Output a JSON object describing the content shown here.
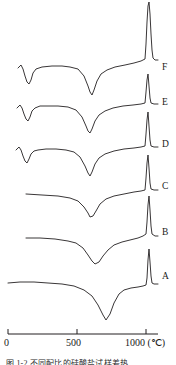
{
  "figure": {
    "kind": "thermal-analysis-curves",
    "caption_fragment": "图 1-2  不同配比的硅酸盐试样差热"
  },
  "axis": {
    "label_unit": "(℃)",
    "tick_labels": [
      "0",
      "500",
      "1000 (℃)"
    ],
    "tick_values": [
      0,
      500,
      1000
    ],
    "xmin": 0,
    "xmax": 1100
  },
  "curve_labels": [
    {
      "id": "F",
      "text": "F",
      "x": 162,
      "y": 63
    },
    {
      "id": "E",
      "text": "E",
      "x": 162,
      "y": 98
    },
    {
      "id": "D",
      "text": "D",
      "x": 162,
      "y": 140
    },
    {
      "id": "C",
      "text": "C",
      "x": 162,
      "y": 182
    },
    {
      "id": "B",
      "text": "B",
      "x": 162,
      "y": 228
    },
    {
      "id": "A",
      "text": "A",
      "x": 162,
      "y": 272
    }
  ],
  "colors": {
    "curve": "#231f20",
    "axis": "#231f20",
    "background": "#ffffff"
  },
  "chart_data": {
    "type": "line",
    "title": "",
    "xlabel": "(℃)",
    "ylabel": "",
    "xlim": [
      0,
      1100
    ],
    "grid": false,
    "legend": "right-inline",
    "tick_labels": [
      "0",
      "500",
      "1000 (℃)"
    ],
    "tick_values": [
      0,
      500,
      1000
    ],
    "series": [
      {
        "name": "A",
        "baseline_y": 283,
        "features": [
          {
            "kind": "endothermic-dip",
            "temperature_c": 690,
            "depth_px": 37
          },
          {
            "kind": "exothermic-peak",
            "temperature_c": 1010,
            "height_px": 35
          }
        ],
        "points": [
          [
            8,
            283
          ],
          [
            20,
            282
          ],
          [
            34,
            282
          ],
          [
            48,
            283
          ],
          [
            62,
            284
          ],
          [
            74,
            286
          ],
          [
            84,
            290
          ],
          [
            92,
            296
          ],
          [
            98,
            305
          ],
          [
            103,
            315
          ],
          [
            106,
            320
          ],
          [
            110,
            314
          ],
          [
            114,
            303
          ],
          [
            119,
            294
          ],
          [
            124,
            290
          ],
          [
            131,
            288
          ],
          [
            138,
            287
          ],
          [
            143,
            286
          ],
          [
            146,
            285
          ],
          [
            147,
            278
          ],
          [
            148,
            260
          ],
          [
            149,
            249
          ],
          [
            150,
            262
          ],
          [
            151,
            276
          ],
          [
            152,
            283
          ],
          [
            154,
            284
          ],
          [
            158,
            284
          ]
        ]
      },
      {
        "name": "B",
        "baseline_y": 238,
        "features": [
          {
            "kind": "endothermic-dip",
            "temperature_c": 620,
            "depth_px": 26
          },
          {
            "kind": "exothermic-peak",
            "temperature_c": 1005,
            "height_px": 38
          }
        ],
        "points": [
          [
            26,
            238
          ],
          [
            40,
            238
          ],
          [
            55,
            239
          ],
          [
            68,
            241
          ],
          [
            76,
            243
          ],
          [
            83,
            248
          ],
          [
            88,
            255
          ],
          [
            92,
            261
          ],
          [
            95,
            264
          ],
          [
            99,
            262
          ],
          [
            103,
            256
          ],
          [
            108,
            250
          ],
          [
            114,
            245
          ],
          [
            122,
            242
          ],
          [
            130,
            240
          ],
          [
            138,
            238
          ],
          [
            143,
            236
          ],
          [
            146,
            234
          ],
          [
            147,
            222
          ],
          [
            148,
            205
          ],
          [
            149,
            196
          ],
          [
            150,
            210
          ],
          [
            151,
            226
          ],
          [
            152,
            234
          ],
          [
            155,
            236
          ],
          [
            158,
            236
          ]
        ]
      },
      {
        "name": "C",
        "baseline_y": 194,
        "features": [
          {
            "kind": "endothermic-dip",
            "temperature_c": 600,
            "depth_px": 24
          },
          {
            "kind": "exothermic-peak",
            "temperature_c": 1005,
            "height_px": 36
          }
        ],
        "points": [
          [
            26,
            194
          ],
          [
            42,
            195
          ],
          [
            58,
            196
          ],
          [
            70,
            198
          ],
          [
            78,
            201
          ],
          [
            84,
            207
          ],
          [
            88,
            213
          ],
          [
            90,
            217
          ],
          [
            93,
            216
          ],
          [
            96,
            211
          ],
          [
            100,
            204
          ],
          [
            106,
            199
          ],
          [
            114,
            196
          ],
          [
            124,
            194
          ],
          [
            134,
            192
          ],
          [
            141,
            191
          ],
          [
            145,
            190
          ],
          [
            146,
            178
          ],
          [
            147,
            163
          ],
          [
            148,
            155
          ],
          [
            149,
            168
          ],
          [
            150,
            183
          ],
          [
            151,
            189
          ],
          [
            154,
            190
          ],
          [
            158,
            190
          ]
        ]
      },
      {
        "name": "D",
        "baseline_y": 152,
        "features": [
          {
            "kind": "endothermic-dip",
            "temperature_c": 130,
            "depth_px": 12
          },
          {
            "kind": "endothermic-dip",
            "temperature_c": 600,
            "depth_px": 25
          },
          {
            "kind": "exothermic-peak",
            "temperature_c": 1005,
            "height_px": 35
          }
        ],
        "points": [
          [
            16,
            150
          ],
          [
            19,
            147
          ],
          [
            21,
            150
          ],
          [
            23,
            156
          ],
          [
            25,
            161
          ],
          [
            27,
            163
          ],
          [
            29,
            159
          ],
          [
            31,
            154
          ],
          [
            34,
            151
          ],
          [
            38,
            150
          ],
          [
            46,
            149
          ],
          [
            56,
            149
          ],
          [
            66,
            150
          ],
          [
            74,
            152
          ],
          [
            80,
            157
          ],
          [
            85,
            166
          ],
          [
            88,
            173
          ],
          [
            90,
            176
          ],
          [
            92,
            172
          ],
          [
            95,
            164
          ],
          [
            99,
            158
          ],
          [
            105,
            154
          ],
          [
            114,
            151
          ],
          [
            124,
            149
          ],
          [
            134,
            148
          ],
          [
            141,
            147
          ],
          [
            145,
            146
          ],
          [
            146,
            134
          ],
          [
            147,
            120
          ],
          [
            148,
            112
          ],
          [
            149,
            126
          ],
          [
            150,
            140
          ],
          [
            151,
            146
          ],
          [
            154,
            147
          ],
          [
            158,
            147
          ]
        ]
      },
      {
        "name": "E",
        "baseline_y": 112,
        "features": [
          {
            "kind": "endothermic-dip",
            "temperature_c": 130,
            "depth_px": 14
          },
          {
            "kind": "endothermic-dip",
            "temperature_c": 600,
            "depth_px": 26
          },
          {
            "kind": "exothermic-peak",
            "temperature_c": 1005,
            "height_px": 33
          }
        ],
        "points": [
          [
            17,
            108
          ],
          [
            20,
            105
          ],
          [
            22,
            108
          ],
          [
            24,
            114
          ],
          [
            26,
            119
          ],
          [
            28,
            121
          ],
          [
            30,
            117
          ],
          [
            32,
            111
          ],
          [
            35,
            108
          ],
          [
            40,
            106
          ],
          [
            48,
            106
          ],
          [
            58,
            106
          ],
          [
            68,
            107
          ],
          [
            76,
            110
          ],
          [
            82,
            117
          ],
          [
            86,
            126
          ],
          [
            88,
            131
          ],
          [
            90,
            133
          ],
          [
            92,
            129
          ],
          [
            95,
            121
          ],
          [
            99,
            115
          ],
          [
            105,
            111
          ],
          [
            113,
            108
          ],
          [
            123,
            106
          ],
          [
            133,
            105
          ],
          [
            141,
            104
          ],
          [
            145,
            103
          ],
          [
            146,
            92
          ],
          [
            147,
            80
          ],
          [
            148,
            74
          ],
          [
            149,
            86
          ],
          [
            150,
            98
          ],
          [
            151,
            103
          ],
          [
            154,
            104
          ],
          [
            158,
            104
          ]
        ]
      },
      {
        "name": "F",
        "baseline_y": 70,
        "features": [
          {
            "kind": "endothermic-dip",
            "temperature_c": 130,
            "depth_px": 15
          },
          {
            "kind": "endothermic-dip",
            "temperature_c": 600,
            "depth_px": 28
          },
          {
            "kind": "exothermic-peak",
            "temperature_c": 1005,
            "height_px": 70
          }
        ],
        "points": [
          [
            18,
            68
          ],
          [
            21,
            65
          ],
          [
            23,
            69
          ],
          [
            25,
            76
          ],
          [
            27,
            82
          ],
          [
            29,
            84
          ],
          [
            31,
            80
          ],
          [
            33,
            73
          ],
          [
            36,
            69
          ],
          [
            42,
            67
          ],
          [
            52,
            66
          ],
          [
            62,
            66
          ],
          [
            70,
            67
          ],
          [
            78,
            69
          ],
          [
            84,
            76
          ],
          [
            88,
            86
          ],
          [
            90,
            92
          ],
          [
            92,
            95
          ],
          [
            94,
            90
          ],
          [
            97,
            81
          ],
          [
            101,
            74
          ],
          [
            107,
            70
          ],
          [
            115,
            67
          ],
          [
            125,
            65
          ],
          [
            134,
            63
          ],
          [
            141,
            61
          ],
          [
            145,
            59
          ],
          [
            146,
            44
          ],
          [
            147,
            22
          ],
          [
            148,
            6
          ],
          [
            149,
            2
          ],
          [
            150,
            14
          ],
          [
            151,
            34
          ],
          [
            152,
            50
          ],
          [
            153,
            58
          ],
          [
            155,
            60
          ],
          [
            158,
            60
          ]
        ]
      }
    ]
  }
}
